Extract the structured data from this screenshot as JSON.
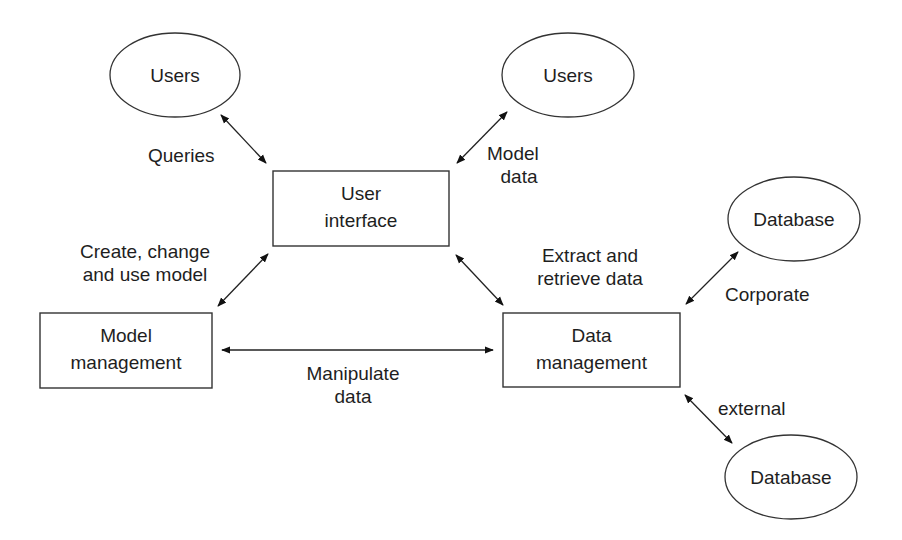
{
  "diagram": {
    "type": "decision-support-system-architecture",
    "nodes": {
      "users_left": {
        "label": "Users",
        "shape": "ellipse"
      },
      "users_right": {
        "label": "Users",
        "shape": "ellipse"
      },
      "user_interface": {
        "line1": "User",
        "line2": "interface",
        "shape": "rectangle"
      },
      "model_management": {
        "line1": "Model",
        "line2": "management",
        "shape": "rectangle"
      },
      "data_management": {
        "line1": "Data",
        "line2": "management",
        "shape": "rectangle"
      },
      "database_corporate": {
        "label": "Database",
        "shape": "ellipse"
      },
      "database_external": {
        "label": "Database",
        "shape": "ellipse"
      }
    },
    "edges": {
      "queries": {
        "from": "users_left",
        "to": "user_interface",
        "label": "Queries",
        "direction": "both"
      },
      "model_data": {
        "from": "users_right",
        "to": "user_interface",
        "line1": "Model",
        "line2": "data",
        "direction": "both"
      },
      "create_change": {
        "from": "user_interface",
        "to": "model_management",
        "line1": "Create, change",
        "line2": "and use model",
        "direction": "both"
      },
      "extract_retrieve": {
        "from": "user_interface",
        "to": "data_management",
        "line1": "Extract and",
        "line2": "retrieve data",
        "direction": "both"
      },
      "manipulate": {
        "from": "model_management",
        "to": "data_management",
        "line1": "Manipulate",
        "line2": "data",
        "direction": "both"
      },
      "corporate": {
        "from": "database_corporate",
        "to": "data_management",
        "label": "Corporate",
        "direction": "both"
      },
      "external": {
        "from": "data_management",
        "to": "database_external",
        "label": "external",
        "direction": "both"
      }
    },
    "colors": {
      "stroke": "#2a2a2a",
      "background": "#ffffff",
      "text": "#1e1e1e"
    }
  }
}
